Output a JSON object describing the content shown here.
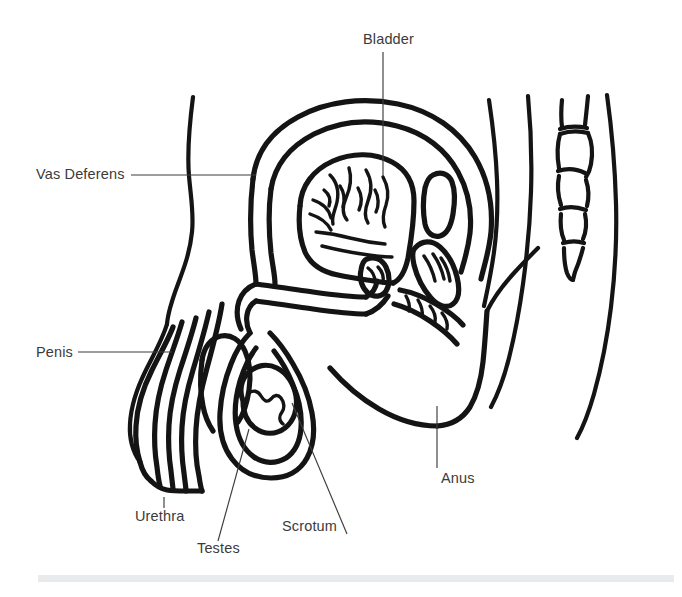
{
  "diagram": {
    "type": "anatomical-line-diagram",
    "background_color": "#ffffff",
    "stroke_color": "#141414",
    "label_color": "#3b3b3b",
    "leader_color": "#3c3c3c",
    "footer_bar_color": "#e9eaeb",
    "labels": [
      {
        "id": "bladder",
        "text": "Bladder",
        "text_x": 363,
        "text_y": 44,
        "anchor": "start",
        "leader": "M 383 52 L 383 176"
      },
      {
        "id": "vas-deferens",
        "text": "Vas Deferens",
        "text_x": 36,
        "text_y": 179,
        "anchor": "start",
        "leader": "M 131 175 L 256 175"
      },
      {
        "id": "penis",
        "text": "Penis",
        "text_x": 36,
        "text_y": 357,
        "anchor": "start",
        "leader": "M 78 352 L 172 352"
      },
      {
        "id": "urethra",
        "text": "Urethra",
        "text_x": 135,
        "text_y": 521,
        "anchor": "start",
        "leader": "M 164 497 L 164 508"
      },
      {
        "id": "testes",
        "text": "Testes",
        "text_x": 197,
        "text_y": 553,
        "anchor": "start",
        "leader": "M 249 429 L 218 541"
      },
      {
        "id": "scrotum",
        "text": "Scrotum",
        "text_x": 282,
        "text_y": 531,
        "anchor": "start",
        "leader": "M 292 403 L 347 534"
      },
      {
        "id": "anus",
        "text": "Anus",
        "text_x": 441,
        "text_y": 483,
        "anchor": "start",
        "leader": "M 437 406 L 437 468"
      }
    ],
    "structures": [
      "abdominal-wall",
      "bladder",
      "bladder-lining",
      "pubic-bone",
      "prostate",
      "seminal-vesicle",
      "rectum",
      "sacrum-coccyx",
      "back-contour",
      "penis-shaft",
      "urethra-channel",
      "scrotum-sac",
      "testis",
      "perineum",
      "buttock"
    ]
  }
}
